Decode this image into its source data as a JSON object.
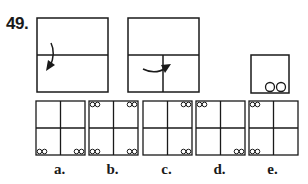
{
  "question": {
    "number": "49."
  },
  "folding_steps": [
    {
      "id": "step-1",
      "description": "square folded top half down along horizontal center line",
      "arrow": "curved arrow pointing down"
    },
    {
      "id": "step-2",
      "description": "folded rectangle folded left to right along vertical line",
      "arrow": "curved arrow pointing right"
    },
    {
      "id": "step-3",
      "description": "folded square with two holes punched at bottom right",
      "holes": 2
    }
  ],
  "answer_options": [
    {
      "label": "a.",
      "holes": {
        "top_left": false,
        "top_right": false,
        "bottom_left": true,
        "bottom_right": true
      }
    },
    {
      "label": "b.",
      "holes": {
        "top_left": true,
        "top_right": true,
        "bottom_left": true,
        "bottom_right": true
      }
    },
    {
      "label": "c.",
      "holes": {
        "top_left": false,
        "top_right": true,
        "bottom_left": false,
        "bottom_right": true
      }
    },
    {
      "label": "d.",
      "holes": {
        "top_left": true,
        "top_right": false,
        "bottom_left": false,
        "bottom_right": true
      }
    },
    {
      "label": "e.",
      "holes": {
        "top_left": true,
        "top_right": false,
        "bottom_left": true,
        "bottom_right": false
      }
    }
  ],
  "colors": {
    "line": "#1a1a1a",
    "background": "#ffffff"
  }
}
